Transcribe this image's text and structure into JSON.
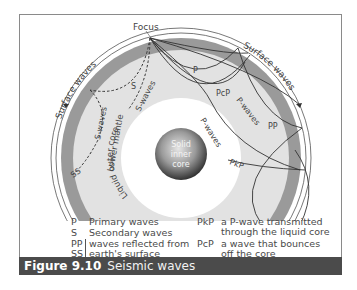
{
  "diagram": {
    "labels": {
      "focus": "Focus",
      "surface_waves_left": "Surface waves",
      "surface_waves_right": "Surface waves",
      "p": "P",
      "pcp": "PcP",
      "p_waves_right": "P-waves",
      "pp": "PP",
      "p_waves_core": "P-waves",
      "pkp": "PkP",
      "s": "S",
      "s_waves_core": "S-waves",
      "s_waves_mantle": "S-waves",
      "ss": "SS",
      "lower_mantle": "Lower mantle",
      "liquid_outer_core": "Liquid outer core",
      "inner_core_line1": "Solid",
      "inner_core_line2": "inner",
      "inner_core_line3": "core"
    },
    "colors": {
      "crust_band": "#9a9a9a",
      "lower_mantle": "#e2e2e2",
      "outer_core": "#ffffff",
      "inner_core_dark": "#3c3c3c",
      "inner_core_light": "#d8d8d8",
      "wave_line": "#333333",
      "caption_bg": "#4b4b4b"
    }
  },
  "legend": {
    "left": [
      {
        "key": "P",
        "text": "Primary waves"
      },
      {
        "key": "S",
        "text": "Secondary waves"
      },
      {
        "key": "PP",
        "text": "waves reflected from"
      },
      {
        "key": "SS",
        "text": "earth's surface"
      }
    ],
    "right": [
      {
        "key": "PkP",
        "line1": "a P-wave transmitted",
        "line2": "through the liquid core"
      },
      {
        "key": "PcP",
        "line1": "a wave that bounces",
        "line2": "off the core"
      }
    ]
  },
  "caption": {
    "number": "Figure 9.10",
    "title": "Seismic waves"
  }
}
